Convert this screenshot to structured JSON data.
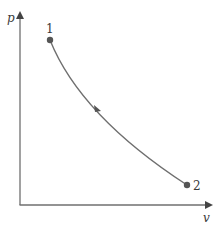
{
  "diagram": {
    "type": "p-v process diagram",
    "axes": {
      "y_label": "p",
      "x_label": "v"
    },
    "states": [
      {
        "label": "1",
        "x": 50,
        "y": 40
      },
      {
        "label": "2",
        "x": 187,
        "y": 185
      }
    ],
    "process": {
      "from": "1",
      "to": "2",
      "shape": "concave decreasing curve",
      "direction_arrow": true
    },
    "colors": {
      "axis": "#6f6f6f",
      "curve": "#6f6f6f",
      "points": "#555555",
      "text": "#3a3a3a",
      "background": "#ffffff"
    }
  }
}
